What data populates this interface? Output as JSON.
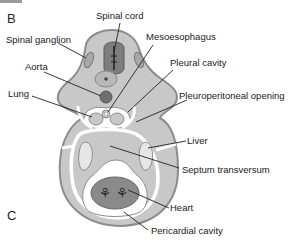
{
  "figure": {
    "panels": {
      "top": "B",
      "bottom": "C"
    },
    "labels": {
      "spinal_cord": "Spinal cord",
      "spinal_ganglion": "Spinal ganglion",
      "mesoesophagus": "Mesoesophagus",
      "aorta": "Aorta",
      "pleural_cavity": "Pleural cavity",
      "lung": "Lung",
      "pleuroperitoneal_opening": "Pleuroperitoneal opening",
      "liver": "Liver",
      "septum_transversum": "Septum transversum",
      "heart": "Heart",
      "pericardial_cavity": "Pericardial cavity"
    },
    "colors": {
      "body_wall": "#c8c8c8",
      "body_outline": "#8c8c8c",
      "cavity": "#ffffff",
      "neural_tube": "#7d7d7d",
      "heart": "#8a8a8a",
      "leader_line": "#222222"
    }
  }
}
